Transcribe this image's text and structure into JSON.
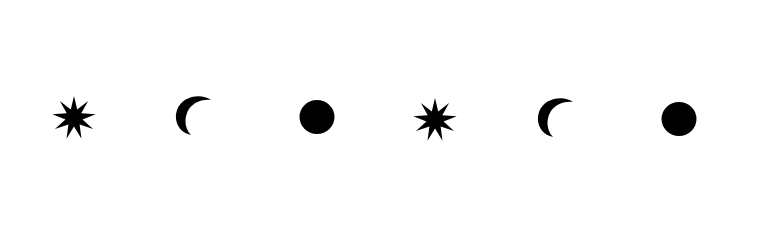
{
  "canvas": {
    "width": 769,
    "height": 147,
    "background": "#ffffff"
  },
  "icons": [
    {
      "type": "star-icon",
      "points": 9,
      "color": "#000000"
    },
    {
      "type": "crescent-icon",
      "color": "#000000"
    },
    {
      "type": "circle-icon",
      "color": "#000000"
    },
    {
      "type": "star-icon",
      "points": 9,
      "color": "#000000"
    },
    {
      "type": "crescent-icon",
      "color": "#000000"
    },
    {
      "type": "circle-icon",
      "color": "#000000"
    }
  ]
}
